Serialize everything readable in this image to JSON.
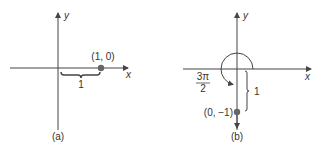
{
  "colors": {
    "line": "#444444",
    "point": "#666666",
    "text": "#333333",
    "background": "#ffffff"
  },
  "panel_a": {
    "caption": "(a)",
    "x_axis_label": "x",
    "y_axis_label": "y",
    "point_label": "(1, 0)",
    "brace_label": "1"
  },
  "panel_b": {
    "caption": "(b)",
    "x_axis_label": "x",
    "y_axis_label": "y",
    "point_label": "(0, −1)",
    "brace_label": "1",
    "angle_numerator": "3π",
    "angle_denominator": "2"
  }
}
